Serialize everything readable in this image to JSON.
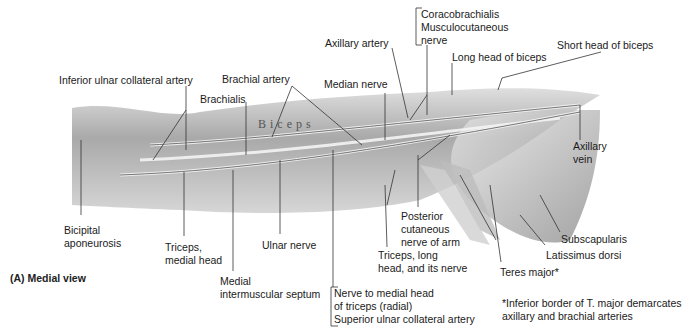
{
  "figure": {
    "title": "(A) Medial view",
    "footnote": "*Inferior border of T. major demarcates\naxillary and brachial arteries",
    "muscle_inscription": "Biceps"
  },
  "labels": {
    "coracobrachialis_group": "Coracobrachialis\nMusculocutaneous\nnerve",
    "axillary_artery": "Axillary artery",
    "long_head_biceps": "Long head of biceps",
    "short_head_biceps": "Short head of biceps",
    "inferior_ulnar_collateral_artery": "Inferior ulnar collateral artery",
    "brachial_artery": "Brachial artery",
    "median_nerve": "Median nerve",
    "brachialis": "Brachialis",
    "axillary_vein": "Axillary\nvein",
    "bicipital_aponeurosis": "Bicipital\naponeurosis",
    "triceps_medial_head": "Triceps,\nmedial head",
    "ulnar_nerve": "Ulnar nerve",
    "medial_intermuscular_septum": "Medial\nintermuscular septum",
    "nerve_group": "Nerve to medial head\nof triceps (radial)\nSuperior ulnar collateral artery",
    "posterior_cutaneous_nerve": "Posterior\ncutaneous\nnerve of arm",
    "triceps_long_head": "Triceps, long\nhead, and its nerve",
    "teres_major": "Teres major*",
    "subscapularis": "Subscapularis",
    "latissimus_dorsi": "Latissimus dorsi"
  }
}
